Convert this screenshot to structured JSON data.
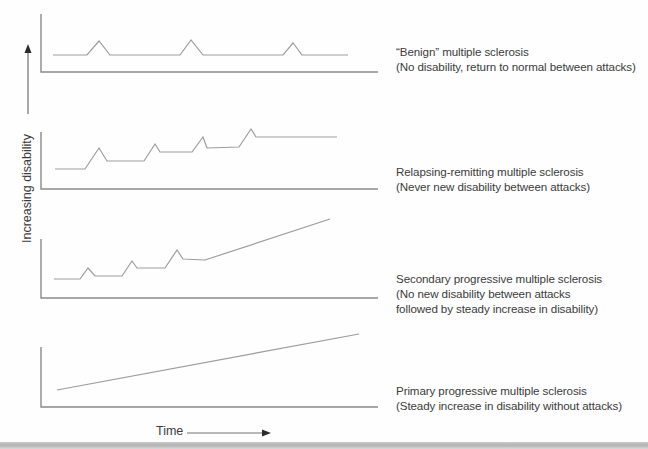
{
  "figure": {
    "y_axis_label": "Increasing disability",
    "x_axis_label": "Time",
    "colors": {
      "axis": "#8a8a8a",
      "curve": "#9c9c9c",
      "arrow_line": "#707070",
      "arrow_head": "#2b2b2b",
      "text": "#3b3b3b"
    },
    "y_arrow": {
      "x": 28,
      "y1": 114,
      "y2": 50,
      "head": [
        [
          28,
          44
        ],
        [
          24.5,
          53
        ],
        [
          31.5,
          53
        ]
      ]
    },
    "x_arrow": {
      "y": 433,
      "x1": 187,
      "x2": 263,
      "head": [
        [
          271,
          433
        ],
        [
          262,
          429.5
        ],
        [
          262,
          436.5
        ]
      ]
    },
    "rows": [
      {
        "title": "“Benign” multiple sclerosis",
        "lines": [
          "(No disability, return to normal between attacks)"
        ]
      },
      {
        "title": "Relapsing-remitting multiple sclerosis",
        "lines": [
          "(Never new disability between attacks)"
        ]
      },
      {
        "title": "Secondary progressive multiple sclerosis",
        "lines": [
          "(No new disability between attacks",
          "followed by steady increase in disability)"
        ]
      },
      {
        "title": "Primary progressive multiple sclerosis",
        "lines": [
          "(Steady increase in disability without attacks)"
        ]
      }
    ]
  },
  "chart_data": [
    {
      "type": "line",
      "name": "benign-ms",
      "description": "flat baseline with full recovery after each attack",
      "axis": {
        "x": 41,
        "top": 14,
        "bottom": 72,
        "right": 378
      },
      "points": [
        [
          53,
          55
        ],
        [
          87,
          55
        ],
        [
          99,
          41
        ],
        [
          110,
          55
        ],
        [
          180,
          55
        ],
        [
          191,
          40
        ],
        [
          203,
          55
        ],
        [
          283,
          55
        ],
        [
          293,
          43
        ],
        [
          302,
          55
        ],
        [
          348,
          55
        ]
      ]
    },
    {
      "type": "line",
      "name": "relapsing-remitting-ms",
      "description": "stepwise plateaus rising after each attack",
      "axis": {
        "x": 41,
        "top": 132,
        "bottom": 189,
        "right": 378
      },
      "points": [
        [
          55,
          169
        ],
        [
          85,
          169
        ],
        [
          99,
          148
        ],
        [
          107,
          161
        ],
        [
          144,
          161
        ],
        [
          155,
          144
        ],
        [
          160,
          152
        ],
        [
          192,
          152
        ],
        [
          203,
          137
        ],
        [
          207,
          148
        ],
        [
          239,
          147
        ],
        [
          251,
          129
        ],
        [
          256,
          137
        ],
        [
          337,
          137
        ]
      ]
    },
    {
      "type": "line",
      "name": "secondary-progressive-ms",
      "description": "attacks followed by steady linear increase",
      "axis": {
        "x": 41,
        "top": 239,
        "bottom": 298,
        "right": 378
      },
      "points": [
        [
          54,
          279
        ],
        [
          80,
          279
        ],
        [
          88,
          268
        ],
        [
          95,
          276
        ],
        [
          122,
          276
        ],
        [
          132,
          261
        ],
        [
          137,
          268
        ],
        [
          165,
          268
        ],
        [
          177,
          250
        ],
        [
          183,
          259
        ],
        [
          205,
          260
        ],
        [
          330,
          219
        ]
      ]
    },
    {
      "type": "line",
      "name": "primary-progressive-ms",
      "description": "steady linear increase without attacks",
      "axis": {
        "x": 41,
        "top": 347,
        "bottom": 407,
        "right": 378
      },
      "points": [
        [
          57,
          390
        ],
        [
          359,
          334
        ]
      ]
    }
  ]
}
